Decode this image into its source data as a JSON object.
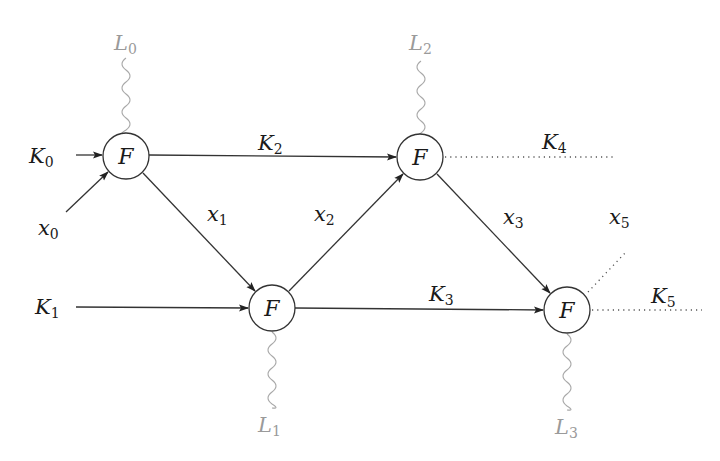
{
  "diagram": {
    "type": "feistel-like key/state network",
    "nodes": [
      {
        "id": "n0",
        "label": "F",
        "cx": 126,
        "cy": 156
      },
      {
        "id": "n1",
        "label": "F",
        "cx": 272,
        "cy": 308
      },
      {
        "id": "n2",
        "label": "F",
        "cx": 420,
        "cy": 157
      },
      {
        "id": "n3",
        "label": "F",
        "cx": 567,
        "cy": 310
      }
    ],
    "labels": {
      "K0": {
        "base": "K",
        "sub": "0"
      },
      "K1": {
        "base": "K",
        "sub": "1"
      },
      "K2": {
        "base": "K",
        "sub": "2"
      },
      "K3": {
        "base": "K",
        "sub": "3"
      },
      "K4": {
        "base": "K",
        "sub": "4"
      },
      "K5": {
        "base": "K",
        "sub": "5"
      },
      "x0": {
        "base": "x",
        "sub": "0"
      },
      "x1": {
        "base": "x",
        "sub": "1"
      },
      "x2": {
        "base": "x",
        "sub": "2"
      },
      "x3": {
        "base": "x",
        "sub": "3"
      },
      "x5": {
        "base": "x",
        "sub": "5"
      },
      "L0": {
        "base": "L",
        "sub": "0"
      },
      "L1": {
        "base": "L",
        "sub": "1"
      },
      "L2": {
        "base": "L",
        "sub": "2"
      },
      "L3": {
        "base": "L",
        "sub": "3"
      }
    },
    "edges": [
      {
        "from": "K0",
        "to": "n0",
        "style": "arrow"
      },
      {
        "from": "x0",
        "to": "n0",
        "style": "arrow"
      },
      {
        "from": "n0",
        "to": "n2",
        "label": "K2",
        "style": "arrow"
      },
      {
        "from": "n0",
        "to": "n1",
        "label": "x1",
        "style": "arrow"
      },
      {
        "from": "K1",
        "to": "n1",
        "style": "arrow"
      },
      {
        "from": "n1",
        "to": "n2",
        "label": "x2",
        "style": "arrow"
      },
      {
        "from": "n1",
        "to": "n3",
        "label": "K3",
        "style": "arrow"
      },
      {
        "from": "n2",
        "to": "n3",
        "label": "x3",
        "style": "arrow"
      },
      {
        "from": "n2",
        "to": "out",
        "label": "K4",
        "style": "dotted"
      },
      {
        "from": "n3",
        "to": "out",
        "label": "x5",
        "style": "dotted"
      },
      {
        "from": "n3",
        "to": "out",
        "label": "K5",
        "style": "dotted"
      },
      {
        "from": "n0",
        "to": "L0",
        "style": "wavy"
      },
      {
        "from": "n1",
        "to": "L1",
        "style": "wavy"
      },
      {
        "from": "n2",
        "to": "L2",
        "style": "wavy"
      },
      {
        "from": "n3",
        "to": "L3",
        "style": "wavy"
      }
    ],
    "colors": {
      "stroke": "#333333",
      "leak_label": "#9a9a9a",
      "wavy": "#a8a8a8"
    }
  }
}
